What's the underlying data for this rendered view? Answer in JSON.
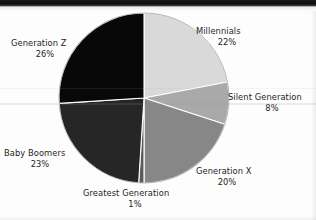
{
  "chart_data": {
    "type": "pie",
    "title": "",
    "subtitle": "",
    "xlabel": "",
    "ylabel": "",
    "legend_position": "none",
    "grid": false,
    "labels_outside": true,
    "start_angle_deg": 0,
    "direction": "clockwise",
    "categories": [
      "Millennials",
      "Silent Generation",
      "Generation X",
      "Greatest Generation",
      "Baby Boomers",
      "Generation Z"
    ],
    "values": [
      22,
      8,
      20,
      1,
      23,
      26
    ],
    "value_labels": [
      "22%",
      "8%",
      "20%",
      "1%",
      "23%",
      "26%"
    ],
    "colors": [
      "#d9d9d9",
      "#a9a9a9",
      "#878787",
      "#5a5a5a",
      "#262626",
      "#080808"
    ],
    "slices": [
      {
        "name": "Millennials",
        "value": 22,
        "value_label": "22%",
        "color": "#d9d9d9"
      },
      {
        "name": "Silent Generation",
        "value": 8,
        "value_label": "8%",
        "color": "#a9a9a9"
      },
      {
        "name": "Generation X",
        "value": 20,
        "value_label": "20%",
        "color": "#878787"
      },
      {
        "name": "Greatest Generation",
        "value": 1,
        "value_label": "1%",
        "color": "#5a5a5a"
      },
      {
        "name": "Baby Boomers",
        "value": 23,
        "value_label": "23%",
        "color": "#262626"
      },
      {
        "name": "Generation Z",
        "value": 26,
        "value_label": "26%",
        "color": "#080808"
      }
    ]
  },
  "labels": {
    "millennials": {
      "name": "Millennials",
      "pct": "22%"
    },
    "silent": {
      "name": "Silent Generation",
      "pct": "8%"
    },
    "genx": {
      "name": "Generation X",
      "pct": "20%"
    },
    "greatest": {
      "name": "Greatest Generation",
      "pct": "1%"
    },
    "boomers": {
      "name": "Baby Boomers",
      "pct": "23%"
    },
    "genz": {
      "name": "Generation Z",
      "pct": "26%"
    }
  }
}
